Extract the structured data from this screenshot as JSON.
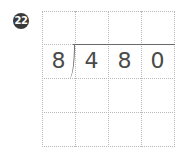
{
  "problem": {
    "number": "22",
    "divisor": "8",
    "dividend_digits": [
      "4",
      "8",
      "0"
    ]
  },
  "grid": {
    "rows": 4,
    "cols": 4,
    "line_color": "#b8b8b8"
  }
}
